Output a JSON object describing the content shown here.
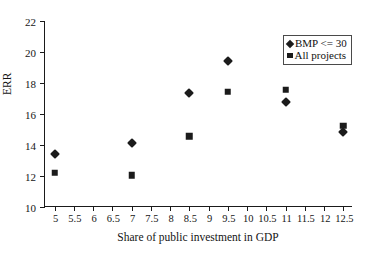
{
  "chart_data": {
    "type": "scatter",
    "title": "",
    "xlabel": "Share of public investment in GDP",
    "ylabel": "ERR",
    "xlim": [
      4.75,
      12.75
    ],
    "ylim": [
      10,
      22
    ],
    "grid": false,
    "legend_position": "top-right",
    "xticks": [
      "5",
      "5.5",
      "6",
      "6.5",
      "7",
      "7.5",
      "8",
      "8.5",
      "9",
      "9.5",
      "10",
      "10.5",
      "11",
      "11.5",
      "12",
      "12.5"
    ],
    "xtick_values": [
      5,
      5.5,
      6,
      6.5,
      7,
      7.5,
      8,
      8.5,
      9,
      9.5,
      10,
      10.5,
      11,
      11.5,
      12,
      12.5
    ],
    "yticks": [
      "10",
      "12",
      "14",
      "16",
      "18",
      "20",
      "22"
    ],
    "ytick_values": [
      10,
      12,
      14,
      16,
      18,
      20,
      22
    ],
    "series": [
      {
        "name": "BMP <= 30",
        "marker": "diamond",
        "color": "#1b1b1b",
        "x": [
          5,
          7,
          8.5,
          9.5,
          11,
          12.5
        ],
        "y": [
          13.4,
          14.15,
          17.35,
          19.45,
          16.75,
          14.85
        ]
      },
      {
        "name": "All projects",
        "marker": "square",
        "color": "#1b1b1b",
        "x": [
          5,
          7,
          8.5,
          9.5,
          11,
          12.5
        ],
        "y": [
          12.2,
          12.05,
          14.55,
          17.45,
          17.55,
          15.25
        ]
      }
    ]
  }
}
